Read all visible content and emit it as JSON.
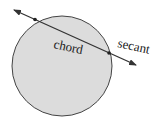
{
  "labels": {
    "chord": "chord",
    "secant": "secant"
  },
  "colors": {
    "circle_fill": "#dcdcdc",
    "stroke": "#333333"
  }
}
